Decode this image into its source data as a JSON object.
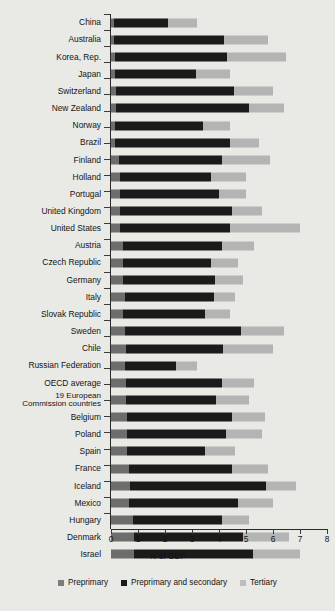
{
  "chart_data": {
    "type": "bar",
    "orientation": "horizontal",
    "stacked": true,
    "title": "",
    "xlabel": "% of GDP",
    "ylabel": "",
    "xlim": [
      0,
      8
    ],
    "xticks": [
      0,
      1,
      2,
      3,
      4,
      5,
      6,
      7,
      8
    ],
    "xticklabels": [
      "0",
      "1",
      "2",
      "3",
      "4",
      "5",
      "6",
      "7",
      "8"
    ],
    "grid": false,
    "legend_position": "bottom",
    "legend": [
      "Preprimary",
      "Preprimary and secondary",
      "Tertiary"
    ],
    "series": [
      {
        "name": "Preprimary",
        "color": "#6d6d6d"
      },
      {
        "name": "Preprimary and secondary",
        "color": "#1b1b1b"
      },
      {
        "name": "Tertiary",
        "color": "#b4b4b4"
      }
    ],
    "categories": [
      "China",
      "Australia",
      "Korea, Rep.",
      "Japan",
      "Switzerland",
      "New Zealand",
      "Norway",
      "Brazil",
      "Finland",
      "Holland",
      "Portugal",
      "United Kingdom",
      "United States",
      "Austria",
      "Czech Republic",
      "Germany",
      "Italy",
      "Slovak Republic",
      "Sweden",
      "Chile",
      "Russian Federation",
      "OECD average",
      "19 European Commission countries",
      "Belgium",
      "Poland",
      "Spain",
      "France",
      "Iceland",
      "Mexico",
      "Hungary",
      "Denmark",
      "Israel"
    ],
    "rows": [
      {
        "label": "China",
        "preprimary": 0.1,
        "secondary": 2.0,
        "tertiary": 1.1,
        "cumulative": [
          0.1,
          2.1,
          3.2
        ]
      },
      {
        "label": "Australia",
        "preprimary": 0.1,
        "secondary": 4.1,
        "tertiary": 1.6,
        "cumulative": [
          0.1,
          4.2,
          5.8
        ]
      },
      {
        "label": "Korea, Rep.",
        "preprimary": 0.15,
        "secondary": 4.15,
        "tertiary": 2.2,
        "cumulative": [
          0.15,
          4.3,
          6.5
        ]
      },
      {
        "label": "Japan",
        "preprimary": 0.15,
        "secondary": 3.0,
        "tertiary": 1.25,
        "cumulative": [
          0.15,
          3.15,
          4.4
        ]
      },
      {
        "label": "Switzerland",
        "preprimary": 0.2,
        "secondary": 4.35,
        "tertiary": 1.45,
        "cumulative": [
          0.2,
          4.55,
          6.0
        ]
      },
      {
        "label": "New Zealand",
        "preprimary": 0.2,
        "secondary": 4.9,
        "tertiary": 1.3,
        "cumulative": [
          0.2,
          5.1,
          6.4
        ]
      },
      {
        "label": "Norway",
        "preprimary": 0.15,
        "secondary": 3.25,
        "tertiary": 1.0,
        "cumulative": [
          0.15,
          3.4,
          4.4
        ]
      },
      {
        "label": "Brazil",
        "preprimary": 0.15,
        "secondary": 4.25,
        "tertiary": 1.1,
        "cumulative": [
          0.15,
          4.4,
          5.5
        ]
      },
      {
        "label": "Finland",
        "preprimary": 0.3,
        "secondary": 3.8,
        "tertiary": 1.8,
        "cumulative": [
          0.3,
          4.1,
          5.9
        ]
      },
      {
        "label": "Holland",
        "preprimary": 0.35,
        "secondary": 3.35,
        "tertiary": 1.3,
        "cumulative": [
          0.35,
          3.7,
          5.0
        ]
      },
      {
        "label": "Portugal",
        "preprimary": 0.35,
        "secondary": 3.65,
        "tertiary": 1.0,
        "cumulative": [
          0.35,
          4.0,
          5.0
        ]
      },
      {
        "label": "United Kingdom",
        "preprimary": 0.35,
        "secondary": 4.15,
        "tertiary": 1.1,
        "cumulative": [
          0.35,
          4.5,
          5.6
        ]
      },
      {
        "label": "United States",
        "preprimary": 0.35,
        "secondary": 4.05,
        "tertiary": 2.6,
        "cumulative": [
          0.35,
          4.4,
          7.0
        ]
      },
      {
        "label": "Austria",
        "preprimary": 0.45,
        "secondary": 3.65,
        "tertiary": 1.2,
        "cumulative": [
          0.45,
          4.1,
          5.3
        ]
      },
      {
        "label": "Czech Republic",
        "preprimary": 0.45,
        "secondary": 3.25,
        "tertiary": 1.0,
        "cumulative": [
          0.45,
          3.7,
          4.7
        ]
      },
      {
        "label": "Germany",
        "preprimary": 0.45,
        "secondary": 3.4,
        "tertiary": 1.05,
        "cumulative": [
          0.45,
          3.85,
          4.9
        ]
      },
      {
        "label": "Italy",
        "preprimary": 0.5,
        "secondary": 3.3,
        "tertiary": 0.8,
        "cumulative": [
          0.5,
          3.8,
          4.6
        ]
      },
      {
        "label": "Slovak Republic",
        "preprimary": 0.45,
        "secondary": 3.05,
        "tertiary": 0.9,
        "cumulative": [
          0.45,
          3.5,
          4.4
        ]
      },
      {
        "label": "Sweden",
        "preprimary": 0.5,
        "secondary": 4.3,
        "tertiary": 1.6,
        "cumulative": [
          0.5,
          4.8,
          6.4
        ]
      },
      {
        "label": "Chile",
        "preprimary": 0.55,
        "secondary": 3.6,
        "tertiary": 1.85,
        "cumulative": [
          0.55,
          4.15,
          6.0
        ]
      },
      {
        "label": "Russian Federation",
        "preprimary": 0.5,
        "secondary": 1.9,
        "tertiary": 0.8,
        "cumulative": [
          0.5,
          2.4,
          3.2
        ]
      },
      {
        "label": "OECD average",
        "preprimary": 0.55,
        "secondary": 3.55,
        "tertiary": 1.2,
        "cumulative": [
          0.55,
          4.1,
          5.3
        ]
      },
      {
        "label": "19 European Commission countries",
        "preprimary": 0.55,
        "secondary": 3.35,
        "tertiary": 1.2,
        "cumulative": [
          0.55,
          3.9,
          5.1
        ]
      },
      {
        "label": "Belgium",
        "preprimary": 0.6,
        "secondary": 3.9,
        "tertiary": 1.2,
        "cumulative": [
          0.6,
          4.5,
          5.7
        ]
      },
      {
        "label": "Poland",
        "preprimary": 0.6,
        "secondary": 3.65,
        "tertiary": 1.35,
        "cumulative": [
          0.6,
          4.25,
          5.6
        ]
      },
      {
        "label": "Spain",
        "preprimary": 0.6,
        "secondary": 2.9,
        "tertiary": 1.1,
        "cumulative": [
          0.6,
          3.5,
          4.6
        ]
      },
      {
        "label": "France",
        "preprimary": 0.65,
        "secondary": 3.85,
        "tertiary": 1.3,
        "cumulative": [
          0.65,
          4.5,
          5.8
        ]
      },
      {
        "label": "Iceland",
        "preprimary": 0.7,
        "secondary": 5.05,
        "tertiary": 1.1,
        "cumulative": [
          0.7,
          5.75,
          6.85
        ]
      },
      {
        "label": "Mexico",
        "preprimary": 0.65,
        "secondary": 4.05,
        "tertiary": 1.3,
        "cumulative": [
          0.65,
          4.7,
          6.0
        ]
      },
      {
        "label": "Hungary",
        "preprimary": 0.8,
        "secondary": 3.3,
        "tertiary": 1.0,
        "cumulative": [
          0.8,
          4.1,
          5.1
        ]
      },
      {
        "label": "Denmark",
        "preprimary": 0.85,
        "secondary": 4.05,
        "tertiary": 1.7,
        "cumulative": [
          0.85,
          4.9,
          6.6
        ]
      },
      {
        "label": "Israel",
        "preprimary": 0.85,
        "secondary": 4.4,
        "tertiary": 1.75,
        "cumulative": [
          0.85,
          5.25,
          7.0
        ]
      }
    ]
  },
  "axis": {
    "x_title": "% of GDP",
    "tick_labels": [
      "0",
      "1",
      "2",
      "3",
      "4",
      "5",
      "6",
      "7",
      "8"
    ]
  },
  "legend": {
    "items": [
      {
        "label": "Preprimary",
        "color": "#6d6d6d"
      },
      {
        "label": "Preprimary and secondary",
        "color": "#1b1b1b"
      },
      {
        "label": "Tertiary",
        "color": "#b4b4b4"
      }
    ]
  }
}
